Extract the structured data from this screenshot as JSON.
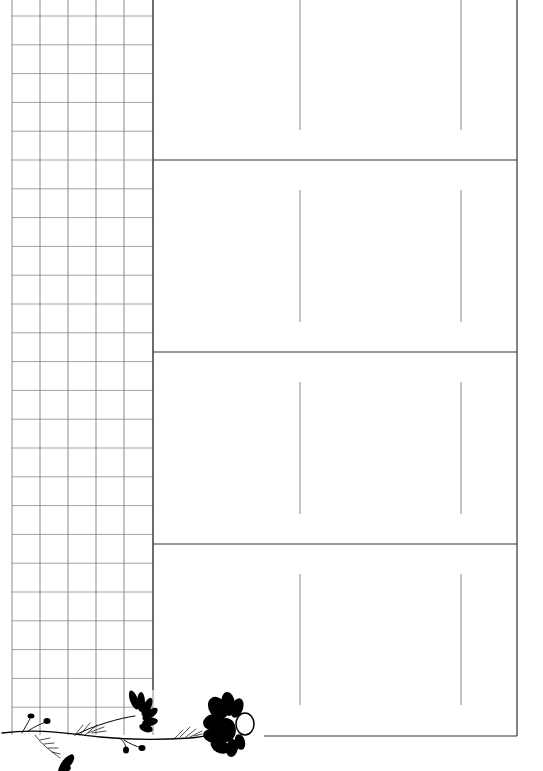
{
  "page": {
    "type": "planner-sheet",
    "width": 543,
    "height": 771,
    "background": "#ffffff"
  },
  "grid": {
    "columns_x": [
      12,
      40,
      68,
      96,
      124,
      153
    ],
    "row_start_y": 16,
    "row_spacing": 28.8,
    "row_count": 25,
    "top": 0,
    "bottom": 735,
    "line_color": "#8a8a8a"
  },
  "frame": {
    "left": 153,
    "right": 517,
    "top": 0,
    "bottom": 736,
    "left_edge_bottom": 690,
    "bottom_line_start_x": 264,
    "line_color": "#333333"
  },
  "panels": [
    {
      "top": 0,
      "bottom": 160,
      "divider_lines": [
        {
          "x": 300,
          "y1": 0,
          "y2": 130
        },
        {
          "x": 461,
          "y1": 0,
          "y2": 130
        }
      ]
    },
    {
      "top": 160,
      "bottom": 352,
      "divider_lines": [
        {
          "x": 300,
          "y1": 190,
          "y2": 322
        },
        {
          "x": 461,
          "y1": 190,
          "y2": 322
        }
      ]
    },
    {
      "top": 352,
      "bottom": 544,
      "divider_lines": [
        {
          "x": 300,
          "y1": 382,
          "y2": 514
        },
        {
          "x": 461,
          "y1": 382,
          "y2": 514
        }
      ]
    },
    {
      "top": 544,
      "bottom": 736,
      "divider_lines": [
        {
          "x": 300,
          "y1": 574,
          "y2": 705
        },
        {
          "x": 461,
          "y1": 574,
          "y2": 705
        }
      ]
    }
  ],
  "decoration": {
    "name": "floral-vine",
    "color": "#000000"
  }
}
